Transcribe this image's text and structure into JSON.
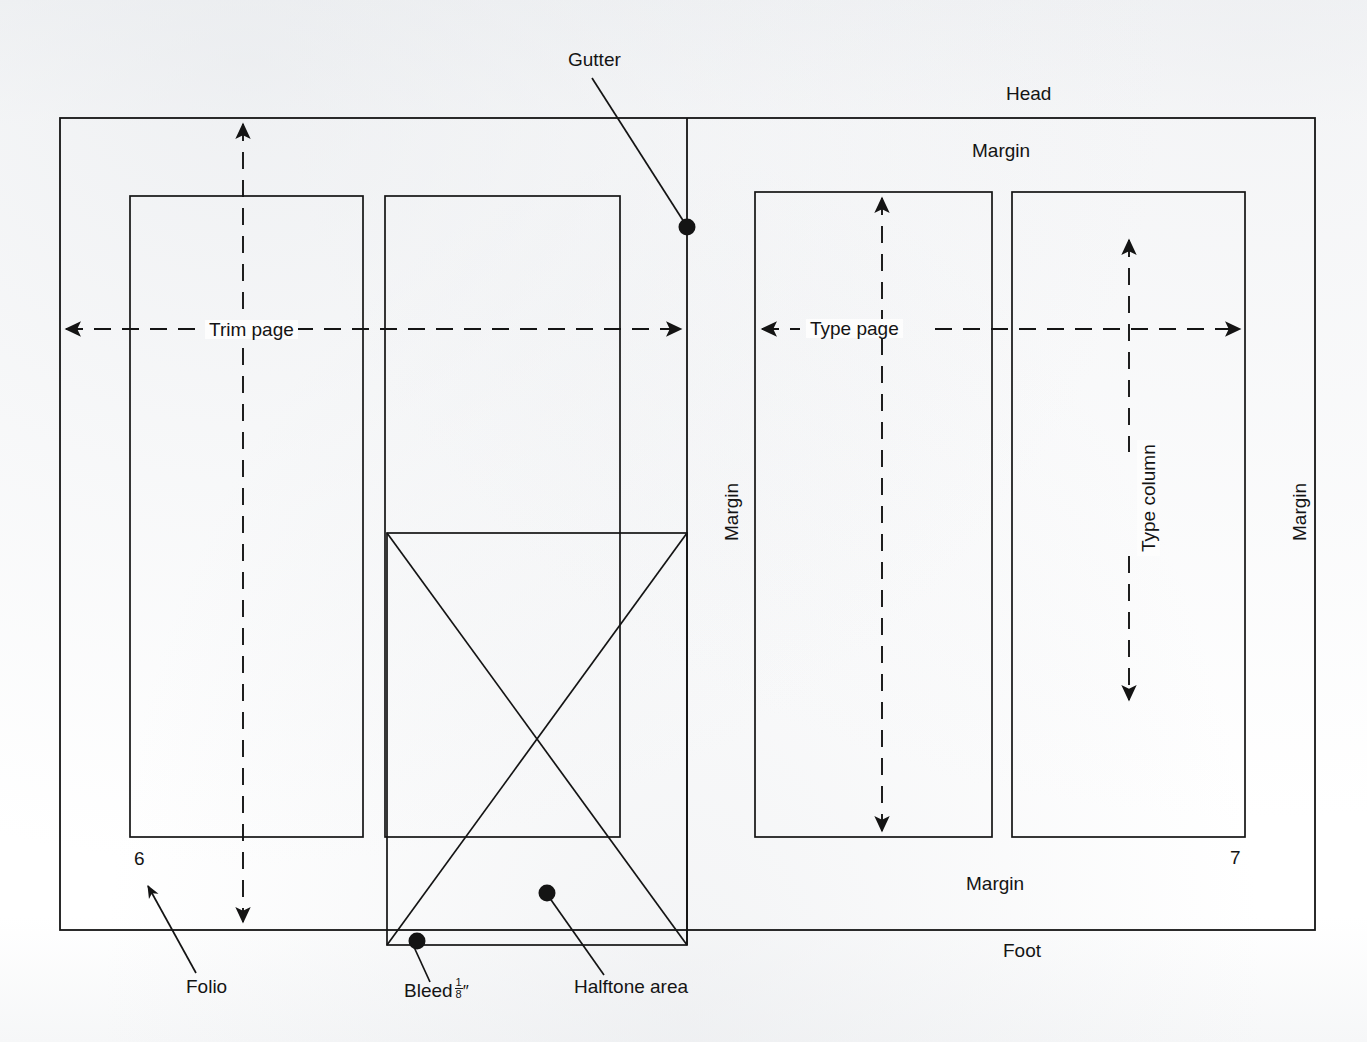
{
  "diagram": {
    "stroke_color": "#141414",
    "background_color": "#fdfdfd",
    "labels": {
      "gutter": "Gutter",
      "head": "Head",
      "margin_top_right": "Margin",
      "margin_bottom_right": "Margin",
      "margin_vertical_center": "Margin",
      "margin_vertical_right": "Margin",
      "foot": "Foot",
      "trim_page": "Trim page",
      "type_page": "Type page",
      "type_column": "Type column",
      "folio": "Folio",
      "bleed": "Bleed",
      "bleed_fraction_numerator": "1",
      "bleed_fraction_denominator": "8",
      "bleed_inch_mark": "″",
      "halftone_area": "Halftone area"
    },
    "folios": {
      "verso": "6",
      "recto": "7"
    },
    "callout_dots": [
      {
        "name": "gutter-dot",
        "x": 687,
        "y": 227
      },
      {
        "name": "halftone-dot",
        "x": 547,
        "y": 893
      },
      {
        "name": "bleed-dot",
        "x": 417,
        "y": 941
      }
    ],
    "dimensions": {
      "trim_frame": {
        "x": 60,
        "y": 118,
        "width": 1255,
        "height": 812
      },
      "gutter_x": 687,
      "verso_columns": [
        {
          "x": 130,
          "y": 196,
          "width": 233,
          "height": 641
        },
        {
          "x": 385,
          "y": 196,
          "width": 235,
          "height": 641
        }
      ],
      "recto_columns": [
        {
          "x": 755,
          "y": 192,
          "width": 237,
          "height": 645
        },
        {
          "x": 1012,
          "y": 192,
          "width": 233,
          "height": 645
        }
      ],
      "bleed_box": {
        "x": 387,
        "y": 533,
        "width": 300,
        "height": 412
      }
    }
  }
}
